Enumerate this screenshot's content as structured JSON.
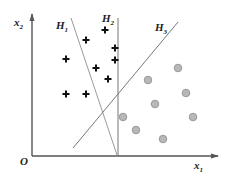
{
  "diagram": {
    "title": "",
    "axes": {
      "x_label": "x",
      "x_sub": "1",
      "y_label": "x",
      "y_sub": "2",
      "origin_label": "O",
      "color": "#555555"
    },
    "hyperplanes": [
      {
        "label": "H",
        "sub": "1",
        "x1": 71,
        "y1": 18,
        "x2": 117,
        "y2": 155,
        "lx": 56,
        "ly": 29,
        "color": "#9a9a9a"
      },
      {
        "label": "H",
        "sub": "2",
        "x1": 118,
        "y1": 18,
        "x2": 118,
        "y2": 156,
        "lx": 102,
        "ly": 22,
        "color": "#777777"
      },
      {
        "label": "H",
        "sub": "3",
        "x1": 178,
        "y1": 22,
        "x2": 73,
        "y2": 148,
        "lx": 155,
        "ly": 31,
        "color": "#777777"
      }
    ],
    "plus_class": {
      "symbol": "+",
      "color": "#111111",
      "points": [
        [
          105,
          30
        ],
        [
          86,
          40
        ],
        [
          115,
          48
        ],
        [
          66,
          59
        ],
        [
          115,
          60
        ],
        [
          96,
          68
        ],
        [
          108,
          79
        ],
        [
          66,
          94
        ],
        [
          86,
          94
        ]
      ]
    },
    "circle_class": {
      "symbol": "circle",
      "fill": "#b8b8b8",
      "stroke": "#8c8c8c",
      "points": [
        [
          178,
          68
        ],
        [
          148,
          80
        ],
        [
          186,
          93
        ],
        [
          155,
          104
        ],
        [
          123,
          117
        ],
        [
          193,
          117
        ],
        [
          136,
          130
        ],
        [
          163,
          139
        ]
      ]
    }
  }
}
